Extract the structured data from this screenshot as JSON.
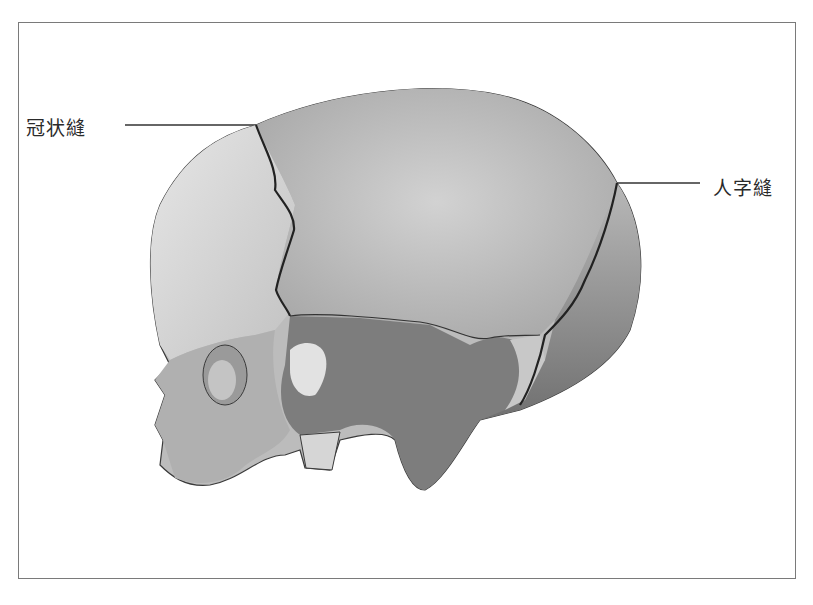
{
  "diagram": {
    "labels": {
      "coronal_suture": "冠状縫",
      "lambdoid_suture": "人字縫"
    },
    "colors": {
      "frame": "#7a7a7a",
      "outline": "#3a3a3a",
      "frontal": "#d6d6d6",
      "parietal": "#bcbcbc",
      "occipital": "#8e8e8e",
      "sphenoid_temporal": "#7a7a7a",
      "face": "#b4b4b4",
      "highlight": "#e2e2e2"
    }
  }
}
